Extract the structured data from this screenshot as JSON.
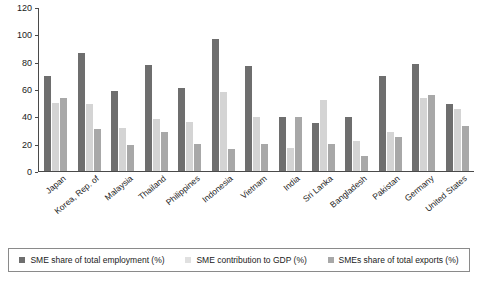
{
  "chart_data": {
    "type": "bar",
    "title": "",
    "subtitle": "",
    "xlabel": "",
    "ylabel": "",
    "ylim": [
      0,
      120
    ],
    "yticks": [
      0,
      20,
      40,
      60,
      80,
      100,
      120
    ],
    "grid": false,
    "legend_position": "bottom",
    "categories": [
      "Japan",
      "Korea, Rep. of",
      "Malaysia",
      "Thailand",
      "Philippines",
      "Indonesia",
      "Vietnam",
      "India",
      "Sri Lanka",
      "Bangladesh",
      "Pakistan",
      "Germany",
      "United States"
    ],
    "series": [
      {
        "name": "SME share of total employment (%)",
        "color": "#6e6e6e",
        "values": [
          70,
          87,
          59,
          78,
          61,
          97,
          77,
          40,
          35,
          40,
          70,
          79,
          49
        ]
      },
      {
        "name": "SME contribution to GDP (%)",
        "color": "#d4d4d4",
        "values": [
          50,
          49,
          32,
          38,
          36,
          58,
          40,
          17,
          52,
          22,
          29,
          54,
          46
        ]
      },
      {
        "name": "SMEs share of total exports (%)",
        "color": "#a8a8a8",
        "values": [
          54,
          31,
          19,
          29,
          20,
          16,
          20,
          40,
          20,
          11,
          25,
          56,
          33
        ]
      }
    ]
  },
  "legend": {
    "items": [
      {
        "label": "SME share of total employment (%)",
        "swatch": "s0"
      },
      {
        "label": "SME contribution to GDP (%)",
        "swatch": "s1"
      },
      {
        "label": "SMEs share of total exports (%)",
        "swatch": "s2"
      }
    ]
  }
}
